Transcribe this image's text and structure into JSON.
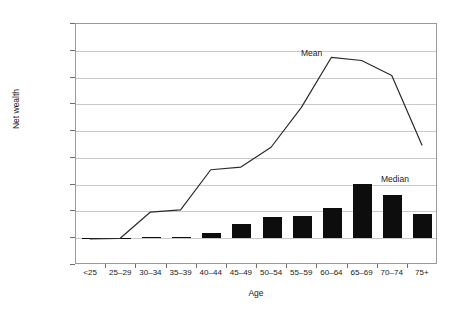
{
  "chart_data": {
    "type": "bar",
    "title": "",
    "xlabel": "Age",
    "ylabel": "Net wealth",
    "categories": [
      "<25",
      "25–29",
      "30–34",
      "35–39",
      "40–44",
      "45–49",
      "50–54",
      "55–59",
      "60–64",
      "65–69",
      "70–74",
      "75+"
    ],
    "ylim": [
      -5000,
      40000
    ],
    "ytick_values": [
      40000,
      35000,
      30000,
      25000,
      20000,
      15000,
      10000,
      5000,
      0,
      -5000
    ],
    "ytick_labels": [
      "£40,000",
      "£35,000",
      "£30,000",
      "£25,000",
      "£20,000",
      "£15,000",
      "£10,000",
      "£5,000",
      "£0",
      "-£5,000"
    ],
    "currency_symbol": "£",
    "grid": true,
    "legend_position": "inline-annotation",
    "series": [
      {
        "name": "Median",
        "type": "bar",
        "color": "#0d0d0d",
        "label_text": "Median",
        "values": [
          0,
          100,
          200,
          300,
          1000,
          2700,
          4000,
          4200,
          5700,
          10100,
          8000,
          4500
        ]
      },
      {
        "name": "Mean",
        "type": "line",
        "color": "#2b2b2b",
        "label_text": "Mean",
        "values": [
          -300,
          -200,
          4700,
          5100,
          12600,
          13100,
          16800,
          24200,
          33600,
          33000,
          30200,
          17200
        ]
      }
    ],
    "annotations": [
      {
        "text": "Mean",
        "series": "Mean",
        "x": 301,
        "y": 48
      },
      {
        "text": "Median",
        "series": "Median",
        "x": 381,
        "y": 174
      }
    ]
  },
  "axis": {
    "y_title": "Net wealth",
    "x_title": "Age"
  }
}
